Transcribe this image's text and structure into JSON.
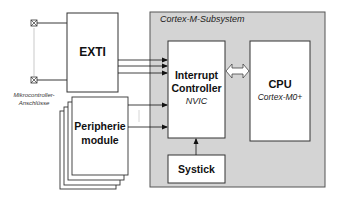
{
  "diagram": {
    "subsystem": {
      "label": "Cortex-M-Subsystem",
      "fill": "#d4d4d4",
      "stroke": "#555555"
    },
    "exti": {
      "label": "EXTI"
    },
    "pins": {
      "label_line1": "Mikrocontroller-",
      "label_line2": "Anschlüsse"
    },
    "peripherals": {
      "line1": "Peripherie",
      "line2": "module"
    },
    "interrupt_controller": {
      "line1": "Interrupt",
      "line2": "Controller",
      "subtitle": "NVIC"
    },
    "cpu": {
      "title": "CPU",
      "subtitle": "Cortex-M0+"
    },
    "systick": {
      "label": "Systick"
    },
    "connections": [
      {
        "from": "EXTI",
        "to": "Interrupt Controller",
        "count": 3,
        "type": "arrow"
      },
      {
        "from": "Peripherie module",
        "to": "Interrupt Controller",
        "count": 2,
        "type": "arrow"
      },
      {
        "from": "Interrupt Controller",
        "to": "CPU",
        "type": "double-arrow"
      },
      {
        "from": "Systick",
        "to": "Interrupt Controller",
        "type": "arrow"
      },
      {
        "from": "Mikrocontroller-Anschlüsse",
        "to": "EXTI",
        "count": 2,
        "type": "line"
      }
    ]
  }
}
